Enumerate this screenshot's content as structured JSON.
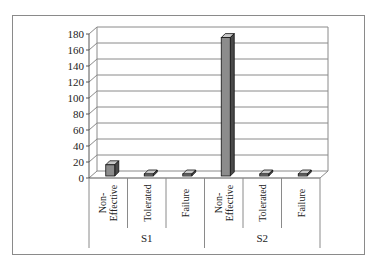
{
  "chart_data": {
    "type": "bar",
    "style": "3d-column",
    "title": "",
    "xlabel": "",
    "ylabel": "",
    "ylim": [
      0,
      180
    ],
    "yticks": [
      0,
      20,
      40,
      60,
      80,
      100,
      120,
      140,
      160,
      180
    ],
    "grid": true,
    "legend": "none",
    "groups": [
      {
        "name": "S1",
        "categories": [
          "Non-Effective",
          "Tolerated",
          "Failure"
        ],
        "values": [
          19,
          3,
          0.5
        ]
      },
      {
        "name": "S2",
        "categories": [
          "Non-Effective",
          "Tolerated",
          "Failure"
        ],
        "values": [
          178,
          0.5,
          5
        ]
      }
    ],
    "categories": [
      "S1 Non-Effective",
      "S1 Tolerated",
      "S1 Failure",
      "S2 Non-Effective",
      "S2 Tolerated",
      "S2 Failure"
    ],
    "values": [
      19,
      3,
      0.5,
      178,
      0.5,
      5
    ],
    "colors": {
      "bar_front": "#8c8c8c",
      "bar_side": "#4a4a4a",
      "bar_top": "#c8c8c8",
      "grid": "#8a8a8a",
      "frame": "#8a8a8a"
    }
  }
}
